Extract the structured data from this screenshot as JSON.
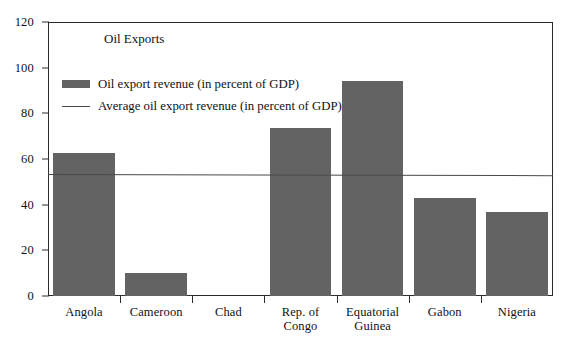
{
  "chart_data": {
    "type": "bar",
    "title": "Oil Exports",
    "xlabel": "",
    "ylabel": "",
    "ylim": [
      0,
      120
    ],
    "yticks": [
      0,
      20,
      40,
      60,
      80,
      100,
      120
    ],
    "ytick_labels": [
      "0",
      "20",
      "40",
      "60",
      "80",
      "100",
      "120"
    ],
    "grid": false,
    "legend_position": "upper-left-inside",
    "categories": [
      "Angola",
      "Cameroon",
      "Chad",
      "Rep. of\nCongo",
      "Equatorial\nGuinea",
      "Gabon",
      "Nigeria"
    ],
    "series": [
      {
        "name": "Oil export revenue (in percent of GDP)",
        "type": "bar",
        "color": "#636363",
        "values": [
          62.5,
          10.0,
          0.0,
          73.5,
          94.0,
          42.8,
          37.0
        ]
      },
      {
        "name": "Average oil export revenue (in percent of GDP)",
        "type": "line",
        "color": "#4a4a4a",
        "values": [
          53.6,
          53.6,
          53.5,
          53.4,
          53.3,
          53.2,
          53.1
        ]
      }
    ],
    "legend": [
      {
        "label": "Oil export revenue (in percent of GDP)",
        "marker": "bar-swatch",
        "color": "#636363"
      },
      {
        "label": "Average oil export revenue (in percent of GDP)",
        "marker": "line-swatch",
        "color": "#4a4a4a"
      }
    ]
  }
}
